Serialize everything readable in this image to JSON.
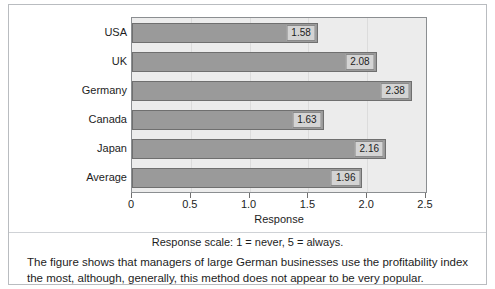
{
  "chart_data": {
    "type": "bar",
    "orientation": "horizontal",
    "categories": [
      "USA",
      "UK",
      "Germany",
      "Canada",
      "Japan",
      "Average"
    ],
    "values": [
      1.58,
      2.08,
      2.38,
      1.63,
      2.16,
      1.96
    ],
    "value_labels": [
      "1.58",
      "2.08",
      "2.38",
      "1.63",
      "2.16",
      "1.96"
    ],
    "title": "",
    "xlabel": "Response",
    "ylabel": "",
    "xlim": [
      0,
      2.5
    ],
    "xticks": [
      0,
      0.5,
      1.0,
      1.5,
      2.0,
      2.5
    ],
    "xticklabels": [
      "0",
      "0.5",
      "1.0",
      "1.5",
      "2.0",
      "2.5"
    ],
    "grid": true,
    "legend": false,
    "bar_color": "#9a9a9a",
    "bar_edge_color": "#6f6f6f",
    "plot_background": "#ececec",
    "label_box_color": "#d4d4d4"
  },
  "notes": {
    "scale_note": "Response scale: 1 = never, 5 = always."
  },
  "caption": {
    "text": "The figure shows that managers of large German businesses use the profitability index the most, although, generally, this method does not appear to be very popular."
  }
}
